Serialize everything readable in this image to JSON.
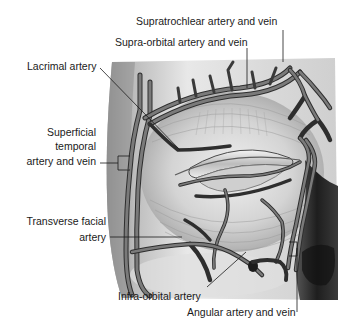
{
  "figure": {
    "colors": {
      "background": "#ffffff",
      "skin_light": "#e4e4e4",
      "skin_mid": "#c8c8c8",
      "skin_dark": "#8a8a8a",
      "shadow": "#2a2a2a",
      "vessel_fill": "#6e6e6e",
      "vessel_outline": "#2e2e2e",
      "leader_line": "#1a1a1a",
      "text": "#1a1a1a"
    }
  },
  "labels": [
    {
      "id": "supratrochlear",
      "text": "Supratrochlear artery and vein"
    },
    {
      "id": "supraorbital",
      "text": "Supra-orbital artery and vein"
    },
    {
      "id": "lacrimal",
      "text": "Lacrimal artery"
    },
    {
      "id": "superficial_temporal_1",
      "text": "Superficial"
    },
    {
      "id": "superficial_temporal_2",
      "text": "temporal"
    },
    {
      "id": "superficial_temporal_3",
      "text": "artery and vein"
    },
    {
      "id": "transverse_facial_1",
      "text": "Transverse facial"
    },
    {
      "id": "transverse_facial_2",
      "text": "artery"
    },
    {
      "id": "infraorbital",
      "text": "Infra-orbital artery"
    },
    {
      "id": "angular",
      "text": "Angular artery and vein"
    }
  ]
}
